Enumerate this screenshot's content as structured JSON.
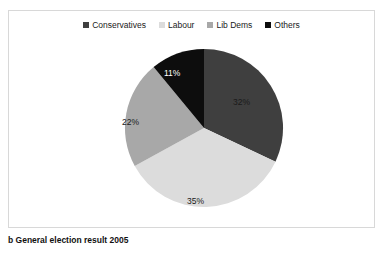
{
  "caption": "b General election result 2005",
  "chart_data": {
    "type": "pie",
    "title": "",
    "categories": [
      "Conservatives",
      "Labour",
      "Lib Dems",
      "Others"
    ],
    "values": [
      32,
      35,
      22,
      11
    ],
    "value_labels": [
      "32%",
      "35%",
      "22%",
      "11%"
    ],
    "colors": [
      "#3f3f3f",
      "#dcdcdc",
      "#a8a8a8",
      "#0d0d0d"
    ],
    "label_colors": [
      "#1a1a1a",
      "#1a1a1a",
      "#1a1a1a",
      "#ffffff"
    ],
    "units": "percent",
    "start_angle_deg": 0,
    "direction": "clockwise",
    "legend": {
      "position": "top",
      "orientation": "horizontal",
      "entries": [
        {
          "label": "Conservatives",
          "color": "#3f3f3f"
        },
        {
          "label": "Labour",
          "color": "#dcdcdc"
        },
        {
          "label": "Lib Dems",
          "color": "#a8a8a8"
        },
        {
          "label": "Others",
          "color": "#0d0d0d"
        }
      ]
    },
    "grid": false,
    "xlabel": "",
    "ylabel": ""
  },
  "slices": [
    {
      "label": "32%",
      "x": 232,
      "y": 97
    },
    {
      "label": "35%",
      "x": 186,
      "y": 196
    },
    {
      "label": "22%",
      "x": 121,
      "y": 117
    },
    {
      "label": "11%",
      "x": 163,
      "y": 68
    }
  ],
  "frame": {
    "border_color": "#d8d8d8",
    "background": "#ffffff"
  }
}
